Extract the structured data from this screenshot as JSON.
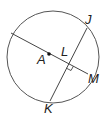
{
  "diagram": {
    "type": "geometry-circle",
    "circle": {
      "center_label": "A",
      "cx": 53,
      "cy": 57,
      "r": 46,
      "stroke": "#555555"
    },
    "points": {
      "A": {
        "label": "A",
        "x": 49,
        "y": 54
      },
      "L": {
        "label": "L",
        "x": 68,
        "y": 64
      },
      "J": {
        "label": "J",
        "x": 87,
        "y": 28
      },
      "K": {
        "label": "K",
        "x": 50,
        "y": 101
      },
      "M": {
        "label": "M",
        "x": 88,
        "y": 74
      }
    },
    "segments": [
      {
        "name": "diameter-through-A-to-M",
        "from": [
          11,
          33
        ],
        "to": [
          88,
          74
        ]
      },
      {
        "name": "chord-JK",
        "from": [
          87,
          28
        ],
        "to": [
          50,
          101
        ]
      }
    ],
    "right_angle_at": "L",
    "label_positions": {
      "J": {
        "x": 85,
        "y": 24
      },
      "A": {
        "x": 37,
        "y": 64
      },
      "L": {
        "x": 61,
        "y": 55
      },
      "M": {
        "x": 89,
        "y": 82
      },
      "K": {
        "x": 44,
        "y": 113
      }
    }
  }
}
